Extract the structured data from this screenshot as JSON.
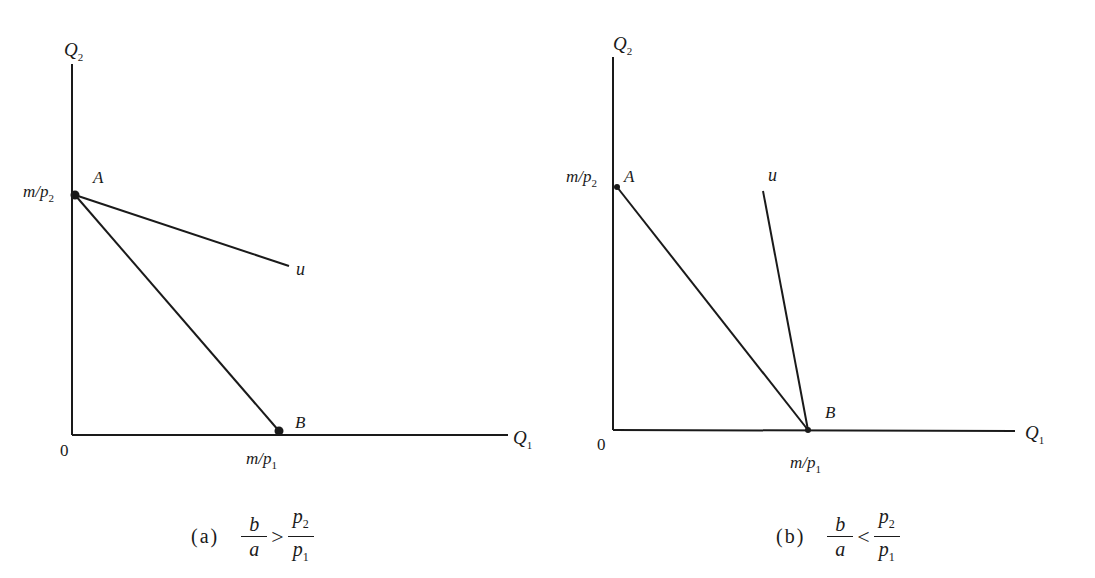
{
  "panels": [
    {
      "id": "a",
      "caption": {
        "tag": "(a)",
        "lhs_num": "b",
        "lhs_den": "a",
        "relation": ">",
        "rhs_num": "p",
        "rhs_num_sub": "2",
        "rhs_den": "p",
        "rhs_den_sub": "1"
      },
      "axes": {
        "y_label": "Q",
        "y_label_sub": "2",
        "x_label": "Q",
        "x_label_sub": "1",
        "origin": "0"
      },
      "intercepts": {
        "y": {
          "text": "m/p",
          "sub": "2"
        },
        "x": {
          "text": "m/p",
          "sub": "1"
        }
      },
      "points": [
        {
          "label": "A"
        },
        {
          "label": "B"
        }
      ],
      "curve_label": "u"
    },
    {
      "id": "b",
      "caption": {
        "tag": "(b)",
        "lhs_num": "b",
        "lhs_den": "a",
        "relation": "<",
        "rhs_num": "p",
        "rhs_num_sub": "2",
        "rhs_den": "p",
        "rhs_den_sub": "1"
      },
      "axes": {
        "y_label": "Q",
        "y_label_sub": "2",
        "x_label": "Q",
        "x_label_sub": "1",
        "origin": "0"
      },
      "intercepts": {
        "y": {
          "text": "m/p",
          "sub": "2"
        },
        "x": {
          "text": "m/p",
          "sub": "1"
        }
      },
      "points": [
        {
          "label": "A"
        },
        {
          "label": "B"
        }
      ],
      "curve_label": "u"
    }
  ]
}
